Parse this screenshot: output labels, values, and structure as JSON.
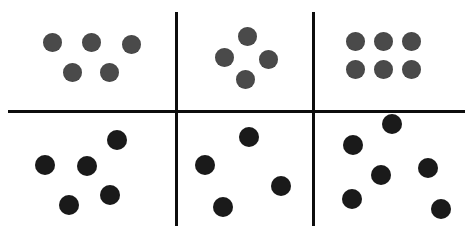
{
  "figure": {
    "width": 475,
    "height": 229,
    "background_color": "#ffffff",
    "grid": {
      "rows": 2,
      "columns": 3
    }
  },
  "dividers": {
    "color": "#0d0d0d",
    "thickness": 3,
    "vertical": [
      {
        "name": "divider-vertical-left",
        "x": 176,
        "y_start": 12,
        "y_end": 226
      },
      {
        "name": "divider-vertical-right",
        "x": 313,
        "y_start": 12,
        "y_end": 226
      }
    ],
    "horizontal": [
      {
        "name": "divider-horizontal-middle",
        "y": 111,
        "x_start": 8,
        "x_end": 465
      }
    ]
  },
  "dot_styles": {
    "regular": {
      "color": "#4a4a4a",
      "diameter": 19
    },
    "scattered": {
      "color": "#1a1a1a",
      "diameter": 20
    }
  },
  "panels": [
    {
      "id": "top-left",
      "label": "Top left panel",
      "arrangement": "regular",
      "pattern": "five-canonical",
      "count": 5,
      "style": "regular",
      "dots": [
        {
          "cx": 52,
          "cy": 42
        },
        {
          "cx": 91,
          "cy": 42
        },
        {
          "cx": 131,
          "cy": 44
        },
        {
          "cx": 72,
          "cy": 72
        },
        {
          "cx": 109,
          "cy": 72
        }
      ]
    },
    {
      "id": "top-middle",
      "label": "Top middle panel",
      "arrangement": "regular",
      "pattern": "four-diamond",
      "count": 4,
      "style": "regular",
      "dots": [
        {
          "cx": 247,
          "cy": 36
        },
        {
          "cx": 224,
          "cy": 57
        },
        {
          "cx": 268,
          "cy": 59
        },
        {
          "cx": 245,
          "cy": 79
        }
      ]
    },
    {
      "id": "top-right",
      "label": "Top right panel",
      "arrangement": "regular",
      "pattern": "six-grid-3x2",
      "count": 6,
      "style": "regular",
      "dots": [
        {
          "cx": 355,
          "cy": 41
        },
        {
          "cx": 383,
          "cy": 41
        },
        {
          "cx": 411,
          "cy": 41
        },
        {
          "cx": 355,
          "cy": 69
        },
        {
          "cx": 383,
          "cy": 69
        },
        {
          "cx": 411,
          "cy": 69
        }
      ]
    },
    {
      "id": "bottom-left",
      "label": "Bottom left panel",
      "arrangement": "scattered",
      "pattern": "five-random",
      "count": 5,
      "style": "scattered",
      "dots": [
        {
          "cx": 117,
          "cy": 140
        },
        {
          "cx": 45,
          "cy": 165
        },
        {
          "cx": 87,
          "cy": 166
        },
        {
          "cx": 110,
          "cy": 195
        },
        {
          "cx": 69,
          "cy": 205
        }
      ]
    },
    {
      "id": "bottom-middle",
      "label": "Bottom middle panel",
      "arrangement": "scattered",
      "pattern": "four-random",
      "count": 4,
      "style": "scattered",
      "dots": [
        {
          "cx": 249,
          "cy": 137
        },
        {
          "cx": 205,
          "cy": 165
        },
        {
          "cx": 281,
          "cy": 186
        },
        {
          "cx": 223,
          "cy": 207
        }
      ]
    },
    {
      "id": "bottom-right",
      "label": "Bottom right panel",
      "arrangement": "scattered",
      "pattern": "six-random",
      "count": 6,
      "style": "scattered",
      "dots": [
        {
          "cx": 392,
          "cy": 124
        },
        {
          "cx": 353,
          "cy": 145
        },
        {
          "cx": 381,
          "cy": 175
        },
        {
          "cx": 428,
          "cy": 168
        },
        {
          "cx": 352,
          "cy": 199
        },
        {
          "cx": 441,
          "cy": 209
        }
      ]
    }
  ]
}
